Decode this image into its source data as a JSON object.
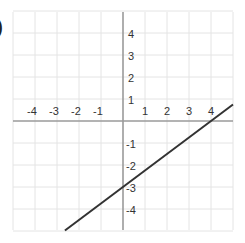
{
  "problem_marker": ")",
  "chart_data": {
    "type": "line",
    "title": "",
    "xlabel": "",
    "ylabel": "",
    "xlim": [
      -5,
      5
    ],
    "ylim": [
      -5,
      5
    ],
    "grid": true,
    "legend": null,
    "x_ticks": [
      -4,
      -3,
      -2,
      -1,
      1,
      2,
      3,
      4
    ],
    "y_ticks": [
      4,
      3,
      2,
      1,
      -1,
      -2,
      -3,
      -4
    ],
    "x_tick_labels": [
      "-4",
      "-3",
      "-2",
      "-1",
      "1",
      "2",
      "3",
      "4"
    ],
    "y_tick_labels": [
      "4",
      "3",
      "2",
      "1",
      "-1",
      "-2",
      "-3",
      "-4"
    ],
    "series": [
      {
        "name": "line",
        "equation": "y = (3/4)x - 3",
        "slope": 0.75,
        "y_intercept": -3,
        "x_intercept": 4,
        "x": [
          -2.64,
          5
        ],
        "y": [
          -4.98,
          0.75
        ]
      }
    ]
  },
  "colors": {
    "grid": "#e4e4e4",
    "axis": "#9a9a9a",
    "line": "#333333",
    "label": "#333333"
  }
}
